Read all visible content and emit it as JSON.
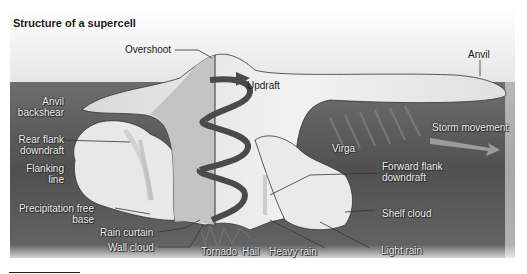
{
  "title": "Structure of a supercell",
  "labels": {
    "overshoot": "Overshoot",
    "anvil": "Anvil",
    "updraft": "Updraft",
    "anvil_backshear": [
      "Anvil",
      "backshear"
    ],
    "rear_flank_downdraft": [
      "Rear flank",
      "downdraft"
    ],
    "flanking_line": [
      "Flanking",
      "line"
    ],
    "precipitation_free_base": [
      "Precipitation free",
      "base"
    ],
    "rain_curtain": "Rain curtain",
    "wall_cloud": "Wall cloud",
    "tornado": "Tornado",
    "hail": "Hail",
    "heavy_rain": "Heavy rain",
    "light_rain": "Light rain",
    "shelf_cloud": "Shelf cloud",
    "forward_flank_downdraft": [
      "Forward flank",
      "downdraft"
    ],
    "virga": "Virga",
    "storm_movement": "Storm movement"
  },
  "colors": {
    "sky": "#f0f0f0",
    "ground": "#5a5a5a",
    "cloud_light": "#ececec",
    "cloud_shade": "#b8b8b8",
    "spiral": "#4a4a4a"
  }
}
